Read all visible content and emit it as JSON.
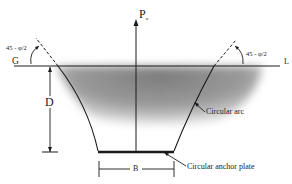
{
  "diagram": {
    "type": "geotechnical-breakout-section",
    "labels": {
      "load": "P",
      "load_subscript": "u",
      "ground_left": "G",
      "ground_right": "L",
      "depth": "D",
      "width": "B",
      "angle_left": "45 - φ/2",
      "angle_right": "45 - φ/2",
      "arc": "Circular arc",
      "plate": "Circular anchor plate"
    },
    "colors": {
      "line": "#1a1a1a",
      "soil_shading": "#8a8a8a",
      "background": "#ffffff"
    }
  }
}
